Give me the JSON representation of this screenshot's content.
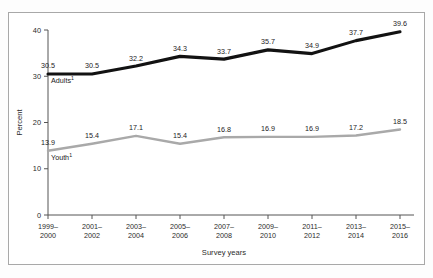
{
  "chart_data": {
    "type": "line",
    "title": "",
    "xlabel": "Survey years",
    "ylabel": "Percent",
    "ylim": [
      0,
      40
    ],
    "yticks": [
      "0",
      "10",
      "20",
      "30",
      "40"
    ],
    "grid": false,
    "legend_position": "inline-series-labels",
    "categories": [
      "1999–\n2000",
      "2001–\n2002",
      "2003–\n2004",
      "2005–\n2006",
      "2007–\n2008",
      "2009–\n2010",
      "2011–\n2012",
      "2013–\n2014",
      "2015–\n2016"
    ],
    "categories_lines": [
      [
        "1999–",
        "2000"
      ],
      [
        "2001–",
        "2002"
      ],
      [
        "2003–",
        "2004"
      ],
      [
        "2005–",
        "2006"
      ],
      [
        "2007–",
        "2008"
      ],
      [
        "2009–",
        "2010"
      ],
      [
        "2011–",
        "2012"
      ],
      [
        "2013–",
        "2014"
      ],
      [
        "2015–",
        "2016"
      ]
    ],
    "series": [
      {
        "name": "Adults",
        "footnote_marker": "1",
        "color": "#121212",
        "values": [
          30.5,
          30.5,
          32.2,
          34.3,
          33.7,
          35.7,
          34.9,
          37.7,
          39.6
        ],
        "labels": [
          "30.5",
          "30.5",
          "32.2",
          "34.3",
          "33.7",
          "35.7",
          "34.9",
          "37.7",
          "39.6"
        ]
      },
      {
        "name": "Youth",
        "footnote_marker": "1",
        "color": "#a9a9a9",
        "values": [
          13.9,
          15.4,
          17.1,
          15.4,
          16.8,
          16.9,
          16.9,
          17.2,
          18.5
        ],
        "labels": [
          "13.9",
          "15.4",
          "17.1",
          "15.4",
          "16.8",
          "16.9",
          "16.9",
          "17.2",
          "18.5"
        ]
      }
    ]
  }
}
